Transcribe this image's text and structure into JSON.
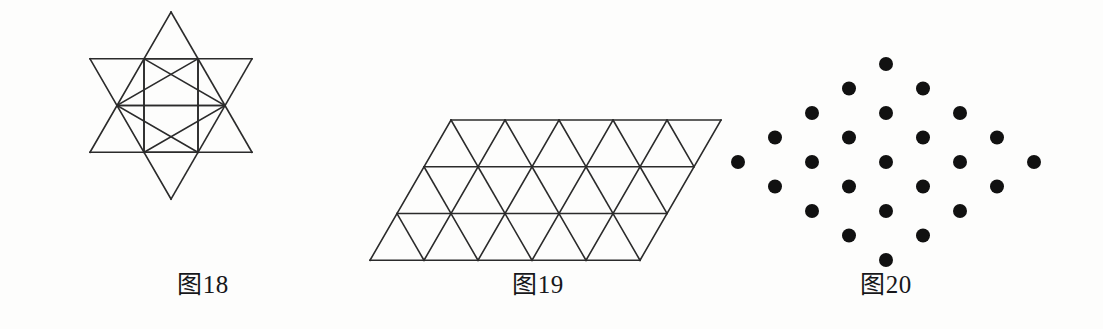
{
  "page": {
    "background_color": "#fdfdfc",
    "ink_color": "#1a1a1a",
    "width": 1103,
    "height": 329
  },
  "figures": [
    {
      "id": "fig18",
      "caption": "图18",
      "shape": "hexagram-triangular-grid",
      "description": "Six-pointed star (Star of David) drawn as a triangular lattice",
      "stroke_color": "#2b2b2b",
      "stroke_width": 1.6,
      "fill": "none",
      "cell_size": 54,
      "rows_of_cells": 4,
      "points": 6
    },
    {
      "id": "fig19",
      "caption": "图19",
      "shape": "parallelogram-triangular-grid",
      "description": "Parallelogram (rhombus slant) tiled with equilateral triangles",
      "stroke_color": "#2b2b2b",
      "stroke_width": 1.6,
      "fill": "none",
      "columns": 5,
      "rows": 3,
      "triangle_count": 30,
      "cell_size": 54
    },
    {
      "id": "fig20",
      "caption": "图20",
      "shape": "diamond-dot-array",
      "description": "Diamond-shaped array of solid black dots in a triangular lattice",
      "dot_color": "#111111",
      "dot_radius": 7,
      "total_dots": 25,
      "rows_counts": [
        1,
        2,
        3,
        4,
        5,
        4,
        3,
        2,
        1
      ]
    }
  ],
  "captions": {
    "fig18": "图18",
    "fig19": "图19",
    "fig20": "图20"
  },
  "chart_data": {
    "type": "scatter",
    "title": "",
    "xlabel": "",
    "ylabel": "",
    "series": [
      {
        "name": "图20 dot array",
        "rows": [
          {
            "row": 1,
            "count": 1,
            "x_offsets": [
              0
            ]
          },
          {
            "row": 2,
            "count": 2,
            "x_offsets": [
              -1,
              1
            ]
          },
          {
            "row": 3,
            "count": 3,
            "x_offsets": [
              -2,
              0,
              2
            ]
          },
          {
            "row": 4,
            "count": 4,
            "x_offsets": [
              -3,
              -1,
              1,
              3
            ]
          },
          {
            "row": 5,
            "count": 5,
            "x_offsets": [
              -4,
              -2,
              0,
              2,
              4
            ]
          },
          {
            "row": 6,
            "count": 4,
            "x_offsets": [
              -3,
              -1,
              1,
              3
            ]
          },
          {
            "row": 7,
            "count": 3,
            "x_offsets": [
              -2,
              0,
              2
            ]
          },
          {
            "row": 8,
            "count": 2,
            "x_offsets": [
              -1,
              1
            ]
          },
          {
            "row": 9,
            "count": 1,
            "x_offsets": [
              0
            ]
          }
        ],
        "total": 25
      }
    ],
    "grid": false,
    "legend": "none"
  }
}
